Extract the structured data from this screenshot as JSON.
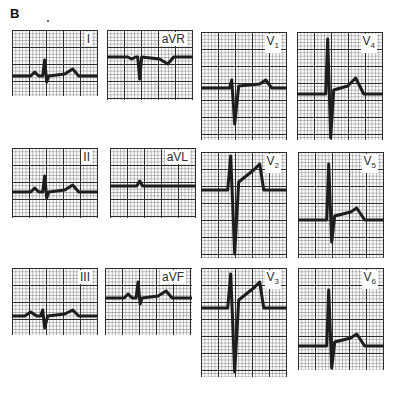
{
  "figure": {
    "label": "B",
    "leads": [
      {
        "id": "I",
        "label": "I",
        "sub": "",
        "box": [
          12,
          30,
          86,
          66
        ],
        "baseline": 46,
        "waveform": "small-positive"
      },
      {
        "id": "aVR",
        "label": "aVR",
        "sub": "",
        "box": [
          107,
          30,
          86,
          70
        ],
        "baseline": 27,
        "waveform": "negative"
      },
      {
        "id": "V1",
        "label": "V",
        "sub": "1",
        "box": [
          201,
          32,
          86,
          108
        ],
        "baseline": 56,
        "waveform": "rS"
      },
      {
        "id": "V4",
        "label": "V",
        "sub": "4",
        "box": [
          297,
          32,
          86,
          108
        ],
        "baseline": 62,
        "waveform": "RS-tall"
      },
      {
        "id": "II",
        "label": "II",
        "sub": "",
        "box": [
          12,
          148,
          86,
          70
        ],
        "baseline": 44,
        "waveform": "small-positive"
      },
      {
        "id": "aVL",
        "label": "aVL",
        "sub": "",
        "box": [
          110,
          148,
          86,
          70
        ],
        "baseline": 38,
        "waveform": "flat"
      },
      {
        "id": "V2",
        "label": "V",
        "sub": "2",
        "box": [
          201,
          152,
          86,
          106
        ],
        "baseline": 38,
        "waveform": "RS-deep"
      },
      {
        "id": "V5",
        "label": "V",
        "sub": "5",
        "box": [
          298,
          152,
          86,
          106
        ],
        "baseline": 68,
        "waveform": "qRs"
      },
      {
        "id": "III",
        "label": "III",
        "sub": "",
        "box": [
          12,
          268,
          86,
          67
        ],
        "baseline": 48,
        "waveform": "small-biphasic"
      },
      {
        "id": "aVF",
        "label": "aVF",
        "sub": "",
        "box": [
          105,
          268,
          87,
          67
        ],
        "baseline": 30,
        "waveform": "small-positive"
      },
      {
        "id": "V3",
        "label": "V",
        "sub": "3",
        "box": [
          201,
          268,
          86,
          109
        ],
        "baseline": 40,
        "waveform": "RS-deep"
      },
      {
        "id": "V6",
        "label": "V",
        "sub": "6",
        "box": [
          298,
          268,
          86,
          102
        ],
        "baseline": 78,
        "waveform": "qRs"
      }
    ]
  },
  "colors": {
    "trace": "#111111",
    "grid_major": "#222222",
    "paper": "#fbfbfb"
  }
}
